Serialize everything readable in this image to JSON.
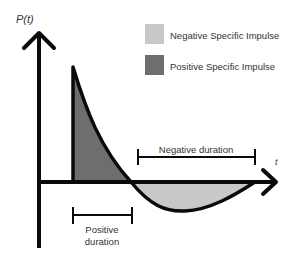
{
  "axes": {
    "y_label": "P(t)",
    "x_label": "t"
  },
  "legend": [
    {
      "label": "Negative Specific Impulse",
      "color": "#c8c8c8"
    },
    {
      "label": "Positive Specific Impulse",
      "color": "#6e6e6e"
    }
  ],
  "annotations": {
    "negative_duration": "Negative duration",
    "positive_duration_line1": "Positive",
    "positive_duration_line2": "duration"
  },
  "colors": {
    "axis": "#0a0a0a",
    "positive_fill": "#6e6e6e",
    "negative_fill": "#c8c8c8",
    "text": "#333333"
  }
}
